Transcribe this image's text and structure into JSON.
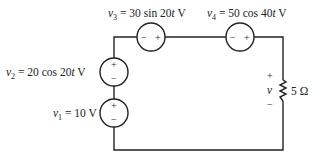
{
  "circuit": {
    "sources": [
      {
        "id": "v1",
        "var": "v",
        "sub": "1",
        "expr": " = 10 V",
        "type": "dc"
      },
      {
        "id": "v2",
        "var": "v",
        "sub": "2",
        "expr": " = 20 cos 20",
        "t": "t",
        "unit": " V",
        "type": "ac"
      },
      {
        "id": "v3",
        "var": "v",
        "sub": "3",
        "expr": " = 30 sin 20",
        "t": "t",
        "unit": " V",
        "type": "ac"
      },
      {
        "id": "v4",
        "var": "v",
        "sub": "4",
        "expr": " = 50 cos 40",
        "t": "t",
        "unit": " V",
        "type": "ac"
      }
    ],
    "resistor": {
      "value": "5 Ω",
      "voltage_label": "v",
      "plus": "+",
      "minus": "−"
    },
    "signs": {
      "plus": "+",
      "minus": "−"
    }
  }
}
